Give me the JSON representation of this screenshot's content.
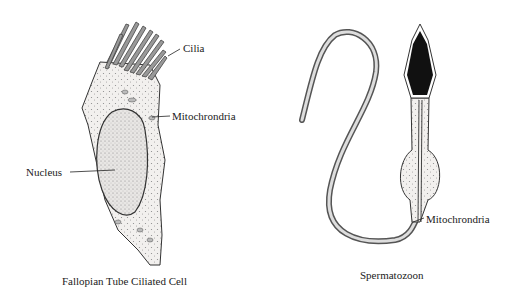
{
  "figure": {
    "left_panel": {
      "caption": "Fallopian Tube Ciliated Cell",
      "labels": {
        "cilia": "Cilia",
        "mitochondria": "Mitochrondria",
        "nucleus": "Nucleus"
      }
    },
    "right_panel": {
      "caption": "Spermatozoon",
      "labels": {
        "mitochondria": "Mitochrondria"
      }
    }
  }
}
